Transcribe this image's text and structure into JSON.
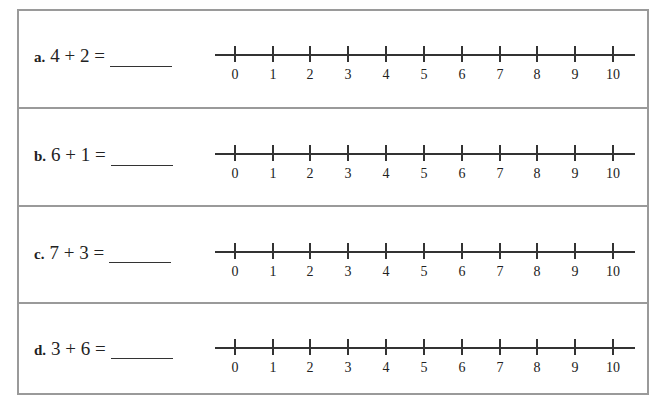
{
  "worksheet": {
    "problems": [
      {
        "letter": "a.",
        "expression": "4 + 2 ="
      },
      {
        "letter": "b.",
        "expression": "6 + 1 ="
      },
      {
        "letter": "c.",
        "expression": "7 + 3 ="
      },
      {
        "letter": "d.",
        "expression": "3 + 6 ="
      }
    ],
    "number_line": {
      "labels": [
        "0",
        "1",
        "2",
        "3",
        "4",
        "5",
        "6",
        "7",
        "8",
        "9",
        "10"
      ]
    }
  }
}
